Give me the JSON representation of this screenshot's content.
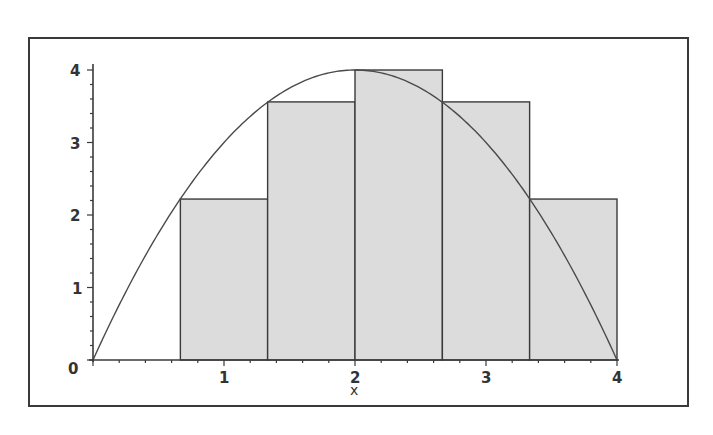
{
  "chart_data": {
    "type": "bar",
    "subtype": "riemann-sum-with-curve",
    "title": "",
    "xlabel": "x",
    "ylabel": "",
    "xlim": [
      0,
      4
    ],
    "ylim": [
      0,
      4
    ],
    "x_ticks": [
      "1",
      "2",
      "3",
      "4"
    ],
    "y_ticks": [
      "0",
      "1",
      "2",
      "3",
      "4"
    ],
    "grid": false,
    "curve": {
      "name": "f(x) = x(4 - x)",
      "x": [
        0,
        0.25,
        0.5,
        0.75,
        1,
        1.25,
        1.5,
        1.75,
        2,
        2.25,
        2.5,
        2.75,
        3,
        3.25,
        3.5,
        3.75,
        4
      ],
      "y": [
        0,
        0.9375,
        1.75,
        2.4375,
        3,
        3.4375,
        3.75,
        3.9375,
        4,
        3.9375,
        3.75,
        3.4375,
        3,
        2.4375,
        1.75,
        0.9375,
        0
      ]
    },
    "bars": [
      {
        "x_start": 0.667,
        "x_end": 1.333,
        "height": 2.22
      },
      {
        "x_start": 1.333,
        "x_end": 2.0,
        "height": 3.56
      },
      {
        "x_start": 2.0,
        "x_end": 2.667,
        "height": 4.0
      },
      {
        "x_start": 2.667,
        "x_end": 3.333,
        "height": 3.56
      },
      {
        "x_start": 3.333,
        "x_end": 4.0,
        "height": 2.22
      }
    ],
    "colors": {
      "bar_fill": "#dcdcdc",
      "bar_stroke": "#3a3a3a",
      "curve": "#4a4a4a",
      "axis": "#3a3a3a",
      "frame": "#3a3a3a"
    }
  },
  "labels": {
    "y0": "0",
    "y1": "1",
    "y2": "2",
    "y3": "3",
    "y4": "4",
    "x1": "1",
    "x2": "2",
    "x3": "3",
    "x4": "4",
    "xaxis": "x"
  }
}
